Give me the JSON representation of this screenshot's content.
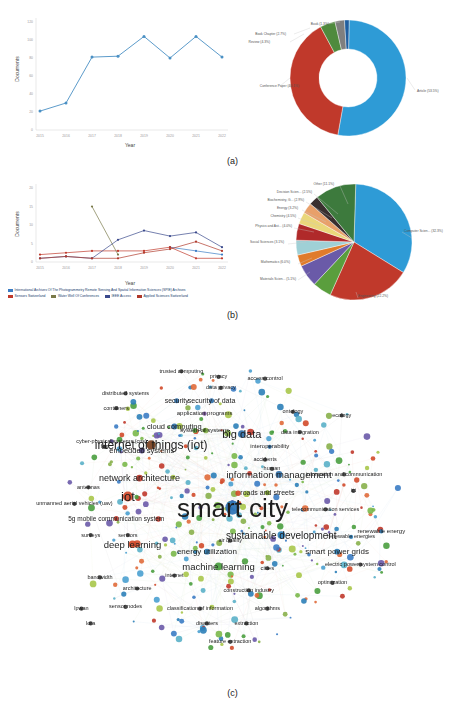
{
  "figure": {
    "captions": {
      "a": "(a)",
      "b": "(b)",
      "c": "(c)"
    }
  },
  "chart_data": [
    {
      "id": "documents-by-year",
      "type": "line",
      "title": "",
      "xlabel": "Year",
      "ylabel": "Documents",
      "categories": [
        "2015",
        "2016",
        "2017",
        "2018",
        "2019",
        "2020",
        "2021",
        "2022"
      ],
      "values": [
        21,
        30,
        81,
        82,
        104,
        80,
        104,
        81
      ],
      "ylim": [
        0,
        120
      ],
      "yticks": [
        "0",
        "20",
        "40",
        "60",
        "80",
        "100",
        "120"
      ],
      "grid": false,
      "legend": "none",
      "color": "#4a90c4"
    },
    {
      "id": "documents-by-type",
      "type": "pie",
      "title": "",
      "donut": true,
      "labels": [
        "Article (53.5%)",
        "Conference Paper  (40.1%)",
        "Review (4.3%)",
        "Book Chapter (2.7%)",
        "Book (1.3%)"
      ],
      "categories": [
        "Article",
        "Conference Paper",
        "Review",
        "Book Chapter",
        "Book"
      ],
      "values": [
        53.5,
        40.1,
        4.3,
        2.7,
        1.3
      ],
      "colors": [
        "#2e9bd6",
        "#c0392b",
        "#4f8a3d",
        "#7f7f7f",
        "#1f5fa0"
      ],
      "legend": "labels-with-leader-lines"
    },
    {
      "id": "documents-per-year-by-source",
      "type": "line",
      "title": "",
      "xlabel": "Year",
      "ylabel": "Documents",
      "categories": [
        "2015",
        "2016",
        "2017",
        "2018",
        "2019",
        "2020",
        "2021",
        "2022"
      ],
      "ylim": [
        0,
        20
      ],
      "yticks": [
        "0",
        "5",
        "10",
        "15",
        "20"
      ],
      "grid": false,
      "legend": "bottom",
      "series": [
        {
          "name": "International Archives Of The Photogrammetry Remote Sensing And Spatial Information Sciences (SPIE) Archives",
          "color": "#3b7cc4",
          "values": [
            null,
            null,
            null,
            null,
            null,
            4,
            3,
            2
          ]
        },
        {
          "name": "Sensors Switzerland",
          "color": "#c0392b",
          "values": [
            2,
            2.5,
            3,
            3,
            3,
            4,
            1,
            1
          ]
        },
        {
          "name": "Water Well Of Conferences",
          "color": "#7a7a4a",
          "values": [
            null,
            null,
            15,
            2,
            null,
            null,
            null,
            null
          ]
        },
        {
          "name": "IEEE Access",
          "color": "#3b4a8c",
          "values": [
            1,
            1.5,
            1,
            6,
            8.5,
            7,
            8,
            4
          ]
        },
        {
          "name": "Applied Sciences Switzerland",
          "color": "#b0392b",
          "values": [
            1,
            1.5,
            1,
            1,
            2.5,
            3.5,
            5.5,
            3
          ]
        }
      ]
    },
    {
      "id": "documents-by-subject-area",
      "type": "pie",
      "title": "",
      "donut": false,
      "labels": [
        "Computer Scien... (32.3%)",
        "Engineering (22.2%)",
        "Materials Scien... (5.1%)",
        "Mathematics (6.0%)",
        "Social Sciences  (3.1%)",
        "Physics and Ast... (4.0%)",
        "Chemistry (4.5%)",
        "Energy (3.2%)",
        "Biochemistry, G... (2.9%)",
        "Decision Scien... (2.5%)",
        "Other (11.1%)"
      ],
      "categories": [
        "Computer Science",
        "Engineering",
        "Materials Science",
        "Mathematics",
        "Social Sciences",
        "Physics and Astronomy",
        "Chemistry",
        "Energy",
        "Biochemistry Genetics",
        "Decision Sciences",
        "Other"
      ],
      "values": [
        32.3,
        22.2,
        5.1,
        6.0,
        3.1,
        4.0,
        4.5,
        3.2,
        2.9,
        2.5,
        11.1
      ],
      "colors": [
        "#2e9bd6",
        "#c0392b",
        "#5a9e3d",
        "#6a5aa8",
        "#e07b2a",
        "#9fd0d6",
        "#b02a2a",
        "#ead77a",
        "#e8a06a",
        "#3a2f2f",
        "#3d7a3d"
      ],
      "legend": "labels-with-leader-lines"
    },
    {
      "id": "keyword-co-occurrence-network",
      "type": "scatter",
      "title": "",
      "note": "VOSviewer-style keyword co-occurrence network; node size = occurrences, color = cluster",
      "terms": [
        {
          "label": "smart city",
          "x": 50.0,
          "y": 51.5,
          "size": 26,
          "color": "#2a72b5",
          "node": 17
        },
        {
          "label": "internet of things (iot)",
          "x": 32.5,
          "y": 34.5,
          "size": 12,
          "color": "#7a3f1f",
          "node": 11
        },
        {
          "label": "iot",
          "x": 27.5,
          "y": 48.5,
          "size": 13,
          "color": "#d14a2a",
          "node": 12
        },
        {
          "label": "big data",
          "x": 52.0,
          "y": 31.5,
          "size": 11,
          "color": "#2f6fa8",
          "node": 9
        },
        {
          "label": "information management",
          "x": 60.0,
          "y": 42.5,
          "size": 9.5,
          "color": "#2f6fa8",
          "node": 8
        },
        {
          "label": "sustainable development",
          "x": 60.5,
          "y": 59.0,
          "size": 10,
          "color": "#2c7fb8",
          "node": 9
        },
        {
          "label": "network architecture",
          "x": 30.0,
          "y": 43.5,
          "size": 9,
          "color": "#c0392b",
          "node": 8
        },
        {
          "label": "deep learning",
          "x": 28.5,
          "y": 61.5,
          "size": 9.5,
          "color": "#d14a2a",
          "node": 9
        },
        {
          "label": "machine learning",
          "x": 47.0,
          "y": 67.5,
          "size": 9.5,
          "color": "#4a9e3f",
          "node": 9
        },
        {
          "label": "smart power grids",
          "x": 72.5,
          "y": 63.5,
          "size": 8,
          "color": "#2c7fb8",
          "node": 7
        },
        {
          "label": "energy utilization",
          "x": 44.5,
          "y": 63.5,
          "size": 8,
          "color": "#2c7fb8",
          "node": 7
        },
        {
          "label": "embedded systems",
          "x": 30.5,
          "y": 36.0,
          "size": 7.5,
          "color": "#4a3f7a",
          "node": 7
        },
        {
          "label": "cloud computing",
          "x": 37.5,
          "y": 29.5,
          "size": 7.5,
          "color": "#2f6fa8",
          "node": 7
        },
        {
          "label": "security of data",
          "x": 45.5,
          "y": 22.5,
          "size": 7,
          "color": "#2f6fa8",
          "node": 6
        },
        {
          "label": "security",
          "x": 38.0,
          "y": 22.5,
          "size": 7,
          "color": "#2f6fa8",
          "node": 6
        },
        {
          "label": "roads and streets",
          "x": 57.5,
          "y": 47.5,
          "size": 7,
          "color": "#7a9e2a",
          "node": 6
        },
        {
          "label": "5g mobile communication system",
          "x": 25.0,
          "y": 54.5,
          "size": 6.5,
          "color": "#c0392b",
          "node": 6
        },
        {
          "label": "system of systems",
          "x": 44.0,
          "y": 30.5,
          "size": 6,
          "color": "#5a8a2a",
          "node": 5
        },
        {
          "label": "application programs",
          "x": 44.0,
          "y": 26.0,
          "size": 6,
          "color": "#6a4a8a",
          "node": 5
        },
        {
          "label": "interoperability",
          "x": 58.0,
          "y": 35.0,
          "size": 6,
          "color": "#2f6fa8",
          "node": 5
        },
        {
          "label": "renewable energy",
          "x": 82.0,
          "y": 58.0,
          "size": 6,
          "color": "#2c7fb8",
          "node": 5
        },
        {
          "label": "renewable energies",
          "x": 75.5,
          "y": 59.5,
          "size": 5.5,
          "color": "#2c7fb8",
          "node": 5
        },
        {
          "label": "cyber-physical systems (cps)",
          "x": 24.0,
          "y": 33.5,
          "size": 5.5,
          "color": "#4a3f7a",
          "node": 5
        },
        {
          "label": "distributed systems",
          "x": 27.0,
          "y": 20.5,
          "size": 5.5,
          "color": "#3a3a3a",
          "node": 5
        },
        {
          "label": "trusted computing",
          "x": 39.0,
          "y": 14.5,
          "size": 5.5,
          "color": "#3a3a3a",
          "node": 5
        },
        {
          "label": "data privacy",
          "x": 47.5,
          "y": 19.0,
          "size": 5.5,
          "color": "#3a3a3a",
          "node": 5
        },
        {
          "label": "privacy",
          "x": 47.0,
          "y": 16.0,
          "size": 5.5,
          "color": "#3a3a3a",
          "node": 5
        },
        {
          "label": "access control",
          "x": 57.0,
          "y": 16.5,
          "size": 5.5,
          "color": "#3a3a3a",
          "node": 5
        },
        {
          "label": "ontology",
          "x": 63.0,
          "y": 25.5,
          "size": 5.5,
          "color": "#3a3a3a",
          "node": 5
        },
        {
          "label": "ecology",
          "x": 73.5,
          "y": 26.5,
          "size": 5.5,
          "color": "#3a3a3a",
          "node": 5
        },
        {
          "label": "data integration",
          "x": 64.5,
          "y": 31.0,
          "size": 5.5,
          "color": "#3a3a3a",
          "node": 5
        },
        {
          "label": "accidents",
          "x": 57.0,
          "y": 38.5,
          "size": 5.5,
          "color": "#3a3a3a",
          "node": 5
        },
        {
          "label": "human",
          "x": 58.5,
          "y": 41.0,
          "size": 5.5,
          "color": "#3a3a3a",
          "node": 5
        },
        {
          "label": "information and communication",
          "x": 74.0,
          "y": 42.5,
          "size": 5.5,
          "color": "#3a3a3a",
          "node": 5
        },
        {
          "label": "ict",
          "x": 76.0,
          "y": 47.0,
          "size": 5.5,
          "color": "#3a3a3a",
          "node": 5
        },
        {
          "label": "telecommunication services",
          "x": 70.0,
          "y": 52.0,
          "size": 5.5,
          "color": "#3a3a3a",
          "node": 5
        },
        {
          "label": "electric power system control",
          "x": 77.5,
          "y": 67.0,
          "size": 5.5,
          "color": "#3a3a3a",
          "node": 5
        },
        {
          "label": "optimization",
          "x": 71.5,
          "y": 72.0,
          "size": 5.5,
          "color": "#3a3a3a",
          "node": 5
        },
        {
          "label": "cities",
          "x": 57.5,
          "y": 68.0,
          "size": 6,
          "color": "#3a3a3a",
          "node": 5
        },
        {
          "label": "air quality",
          "x": 49.5,
          "y": 60.5,
          "size": 5.5,
          "color": "#3a3a3a",
          "node": 5
        },
        {
          "label": "construction industry",
          "x": 53.5,
          "y": 74.0,
          "size": 5.5,
          "color": "#3a3a3a",
          "node": 5
        },
        {
          "label": "algorithms",
          "x": 57.5,
          "y": 79.0,
          "size": 5.5,
          "color": "#3a3a3a",
          "node": 5
        },
        {
          "label": "classification of information",
          "x": 43.0,
          "y": 79.0,
          "size": 5.5,
          "color": "#3a3a3a",
          "node": 5
        },
        {
          "label": "disasters",
          "x": 44.5,
          "y": 83.0,
          "size": 5.5,
          "color": "#3a3a3a",
          "node": 5
        },
        {
          "label": "extraction",
          "x": 53.0,
          "y": 83.0,
          "size": 5.5,
          "color": "#3a3a3a",
          "node": 5
        },
        {
          "label": "feature extraction",
          "x": 49.5,
          "y": 88.0,
          "size": 5.5,
          "color": "#3a3a3a",
          "node": 5
        },
        {
          "label": "sensor nodes",
          "x": 27.0,
          "y": 78.5,
          "size": 5.5,
          "color": "#3a3a3a",
          "node": 5
        },
        {
          "label": "lora",
          "x": 19.5,
          "y": 83.0,
          "size": 5.5,
          "color": "#3a3a3a",
          "node": 5
        },
        {
          "label": "lpwan",
          "x": 17.5,
          "y": 79.0,
          "size": 5.5,
          "color": "#3a3a3a",
          "node": 5
        },
        {
          "label": "architecture",
          "x": 29.5,
          "y": 73.5,
          "size": 5.5,
          "color": "#3a3a3a",
          "node": 5
        },
        {
          "label": "bandwidth",
          "x": 21.5,
          "y": 70.5,
          "size": 5.5,
          "color": "#3a3a3a",
          "node": 5
        },
        {
          "label": "internet",
          "x": 37.5,
          "y": 70.0,
          "size": 5.5,
          "color": "#3a3a3a",
          "node": 5
        },
        {
          "label": "surveys",
          "x": 19.5,
          "y": 59.0,
          "size": 5.5,
          "color": "#3a3a3a",
          "node": 5
        },
        {
          "label": "sensors",
          "x": 27.5,
          "y": 59.0,
          "size": 5.5,
          "color": "#3a3a3a",
          "node": 5
        },
        {
          "label": "antennas",
          "x": 19.0,
          "y": 46.0,
          "size": 5.5,
          "color": "#3a3a3a",
          "node": 5
        },
        {
          "label": "unmanned aerial vehicles (uav)",
          "x": 16.0,
          "y": 50.5,
          "size": 5.5,
          "color": "#3a3a3a",
          "node": 5
        },
        {
          "label": "fog",
          "x": 22.5,
          "y": 35.0,
          "size": 5.5,
          "color": "#3a3a3a",
          "node": 5
        },
        {
          "label": "containers",
          "x": 25.0,
          "y": 24.5,
          "size": 5.5,
          "color": "#3a3a3a",
          "node": 5
        }
      ]
    }
  ]
}
